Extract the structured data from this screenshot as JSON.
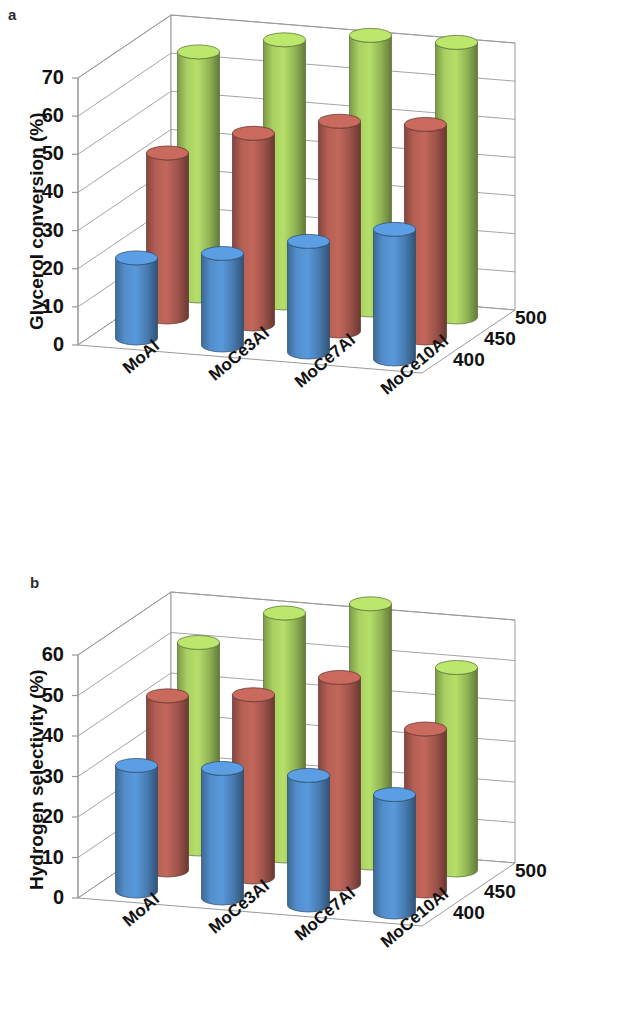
{
  "figure": {
    "panels": [
      {
        "letter": "a",
        "ylabel": "Glycerol conversion (%)",
        "yticks": [
          "0",
          "10",
          "20",
          "30",
          "40",
          "50",
          "60",
          "70"
        ],
        "categories": [
          "MoAl",
          "MoCe3Al",
          "MoCe7Al",
          "MoCe10Al"
        ],
        "zlabels": [
          "400",
          "450",
          "500"
        ]
      },
      {
        "letter": "b",
        "ylabel": "Hydrogen selectivity (%)",
        "yticks": [
          "0",
          "10",
          "20",
          "30",
          "40",
          "50",
          "60"
        ],
        "categories": [
          "MoAl",
          "MoCe3Al",
          "MoCe7Al",
          "MoCe10Al"
        ],
        "zlabels": [
          "400",
          "450",
          "500"
        ]
      }
    ]
  },
  "colors": {
    "series_400": "#4e86c0",
    "series_450": "#ab5a50",
    "series_500": "#9fc45c",
    "axis": "#9a9a9a",
    "text": "#111111"
  },
  "chart_data": [
    {
      "type": "bar",
      "title": "a",
      "subtitle": "",
      "xlabel": "",
      "ylabel": "Glycerol conversion (%)",
      "zlabel": "Temperature (°C)",
      "categories": [
        "MoAl",
        "MoCe3Al",
        "MoCe7Al",
        "MoCe10Al"
      ],
      "ylim": [
        0,
        70
      ],
      "ytick_step": 10,
      "grid": true,
      "legend": "depth-axis",
      "projection": "3d-cylinder",
      "series": [
        {
          "name": "400",
          "values": [
            21,
            24,
            29,
            34
          ]
        },
        {
          "name": "450",
          "values": [
            43,
            50,
            55,
            56
          ]
        },
        {
          "name": "500",
          "values": [
            64,
            69,
            72,
            72
          ]
        }
      ]
    },
    {
      "type": "bar",
      "title": "b",
      "subtitle": "",
      "xlabel": "",
      "ylabel": "Hydrogen selectivity (%)",
      "zlabel": "Temperature (°C)",
      "categories": [
        "MoAl",
        "MoCe3Al",
        "MoCe7Al",
        "MoCe10Al"
      ],
      "ylim": [
        0,
        60
      ],
      "ytick_step": 10,
      "grid": true,
      "legend": "depth-axis",
      "projection": "3d-cylinder",
      "series": [
        {
          "name": "400",
          "values": [
            31,
            32,
            32,
            29
          ]
        },
        {
          "name": "450",
          "values": [
            43,
            45,
            51,
            40
          ]
        },
        {
          "name": "500",
          "values": [
            51,
            60,
            64,
            50
          ]
        }
      ]
    }
  ]
}
